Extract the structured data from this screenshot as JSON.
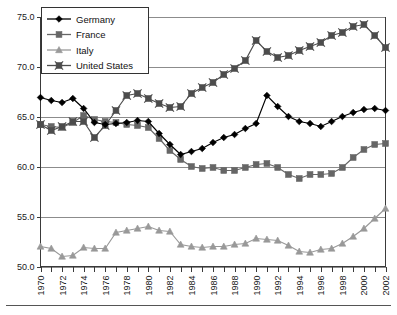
{
  "chart_data": {
    "type": "line",
    "title": "",
    "subtitle": "",
    "xlabel": "",
    "ylabel": "",
    "xlim": [
      1970,
      2002
    ],
    "ylim": [
      50.0,
      75.0
    ],
    "ytick_labels": [
      "50.0",
      "55.0",
      "60.0",
      "65.0",
      "70.0",
      "75.0"
    ],
    "ytick_values": [
      50.0,
      55.0,
      60.0,
      65.0,
      70.0,
      75.0
    ],
    "grid": "horizontal",
    "legend_position": "top-left",
    "x": [
      1970,
      1971,
      1972,
      1973,
      1974,
      1975,
      1976,
      1977,
      1978,
      1979,
      1980,
      1981,
      1982,
      1983,
      1984,
      1985,
      1986,
      1987,
      1988,
      1989,
      1990,
      1991,
      1992,
      1993,
      1994,
      1995,
      1996,
      1997,
      1998,
      1999,
      2000,
      2001,
      2002
    ],
    "xtick_labels": [
      "1970",
      "1972",
      "1974",
      "1976",
      "1978",
      "1980",
      "1982",
      "1984",
      "1986",
      "1988",
      "1990",
      "1992",
      "1994",
      "1996",
      "1998",
      "2000",
      "2002"
    ],
    "xtick_values": [
      1970,
      1972,
      1974,
      1976,
      1978,
      1980,
      1982,
      1984,
      1986,
      1988,
      1990,
      1992,
      1994,
      1996,
      1998,
      2000,
      2002
    ],
    "xtick_every": 1,
    "series": [
      {
        "name": "Germany",
        "color": "#000000",
        "marker": "diamond",
        "values": [
          66.9,
          66.6,
          66.4,
          66.8,
          65.8,
          64.4,
          64.2,
          64.3,
          64.4,
          64.6,
          64.5,
          63.3,
          62.2,
          61.2,
          61.5,
          61.8,
          62.4,
          62.9,
          63.2,
          63.8,
          64.3,
          67.1,
          66.0,
          65.0,
          64.5,
          64.3,
          64.0,
          64.5,
          65.0,
          65.4,
          65.7,
          65.8,
          65.6
        ]
      },
      {
        "name": "France",
        "color": "#666666",
        "marker": "square",
        "values": [
          64.2,
          64.0,
          63.9,
          64.4,
          65.1,
          64.7,
          64.5,
          64.4,
          64.2,
          64.1,
          63.9,
          62.8,
          61.6,
          60.7,
          60.0,
          59.8,
          59.9,
          59.6,
          59.6,
          59.9,
          60.2,
          60.3,
          59.9,
          59.2,
          58.8,
          59.2,
          59.2,
          59.3,
          59.9,
          60.9,
          61.7,
          62.2,
          62.3
        ]
      },
      {
        "name": "Italy",
        "color": "#999999",
        "marker": "triangle",
        "values": [
          52.0,
          51.8,
          51.0,
          51.1,
          51.9,
          51.8,
          51.8,
          53.4,
          53.6,
          53.8,
          54.0,
          53.6,
          53.5,
          52.2,
          52.0,
          51.9,
          52.0,
          52.0,
          52.2,
          52.3,
          52.8,
          52.7,
          52.6,
          52.1,
          51.5,
          51.4,
          51.7,
          51.8,
          52.3,
          53.0,
          53.8,
          54.8,
          55.8
        ]
      },
      {
        "name": "United States",
        "color": "#4d4d4d",
        "marker": "square-x",
        "values": [
          64.2,
          63.6,
          64.0,
          64.5,
          64.5,
          62.9,
          64.1,
          65.6,
          67.1,
          67.3,
          66.8,
          66.3,
          65.9,
          66.0,
          67.3,
          67.9,
          68.4,
          69.2,
          69.8,
          70.6,
          72.6,
          71.5,
          70.9,
          71.1,
          71.6,
          72.0,
          72.4,
          73.1,
          73.4,
          74.0,
          74.2,
          73.1,
          71.9
        ]
      }
    ]
  },
  "legend": {
    "items": [
      {
        "label": "Germany"
      },
      {
        "label": "France"
      },
      {
        "label": "Italy"
      },
      {
        "label": "United States"
      }
    ]
  }
}
